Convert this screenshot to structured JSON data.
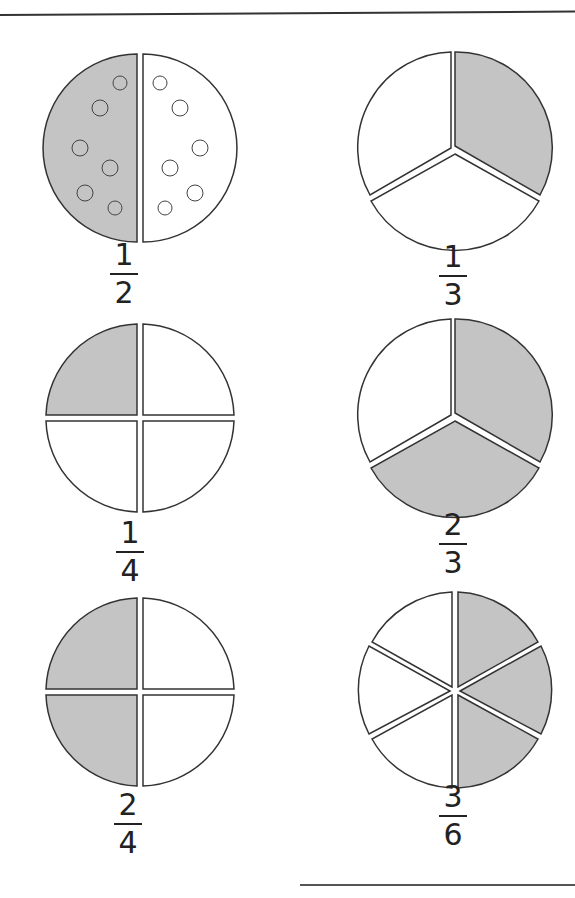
{
  "page": {
    "colors": {
      "shaded": "#c4c4c4",
      "unshaded": "#ffffff",
      "outline": "#333333"
    }
  },
  "pizzas": [
    {
      "id": "half",
      "numerator": "1",
      "denominator": "2",
      "slices": 2,
      "shaded": 1,
      "layout": "vertical-halves"
    },
    {
      "id": "third",
      "numerator": "1",
      "denominator": "3",
      "slices": 3,
      "shaded": 1,
      "layout": "thirds"
    },
    {
      "id": "quarter",
      "numerator": "1",
      "denominator": "4",
      "slices": 4,
      "shaded": 1,
      "layout": "quarters"
    },
    {
      "id": "two-thirds",
      "numerator": "2",
      "denominator": "3",
      "slices": 3,
      "shaded": 2,
      "layout": "thirds"
    },
    {
      "id": "two-quarters",
      "numerator": "2",
      "denominator": "4",
      "slices": 4,
      "shaded": 2,
      "layout": "quarters"
    },
    {
      "id": "three-sixths",
      "numerator": "3",
      "denominator": "6",
      "slices": 6,
      "shaded": 3,
      "layout": "sixths"
    }
  ]
}
